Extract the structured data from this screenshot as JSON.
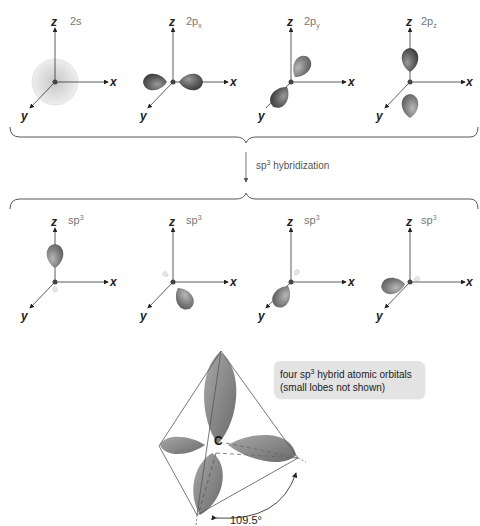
{
  "top_row": {
    "orbitals": [
      {
        "label": "2s",
        "shape": "sphere"
      },
      {
        "label": "2p",
        "subscript": "x",
        "shape": "dumbbell-x"
      },
      {
        "label": "2p",
        "subscript": "y",
        "shape": "dumbbell-y"
      },
      {
        "label": "2p",
        "subscript": "z",
        "shape": "dumbbell-z"
      }
    ]
  },
  "axes": {
    "x": "x",
    "y": "y",
    "z": "z"
  },
  "transition": {
    "label_prefix": "sp",
    "label_sup": "3",
    "label_suffix": " hybridization"
  },
  "bottom_row": {
    "orbitals": [
      {
        "label": "sp",
        "sup": "3",
        "direction": "up"
      },
      {
        "label": "sp",
        "sup": "3",
        "direction": "down-right"
      },
      {
        "label": "sp",
        "sup": "3",
        "direction": "down-left"
      },
      {
        "label": "sp",
        "sup": "3",
        "direction": "left"
      }
    ]
  },
  "tetrahedron": {
    "center_label": "C",
    "angle_label": "109.5°",
    "callout_line1_prefix": "four sp",
    "callout_line1_sup": "3",
    "callout_line1_suffix": " hybrid atomic orbitals",
    "callout_line2": "(small lobes not shown)"
  },
  "colors": {
    "lobe_dark": "#5a5a5a",
    "lobe_mid": "#8a8a8a",
    "lobe_light": "#c8c8c8",
    "axis": "#333333",
    "label_gray": "#777777",
    "callout_bg": "#e3e3e3"
  }
}
